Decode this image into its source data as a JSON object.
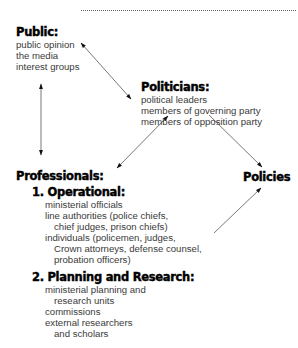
{
  "top_fragment": {
    "chars": [
      "y",
      "y",
      "g"
    ]
  },
  "nodes": {
    "public": {
      "title": "Public:",
      "items": [
        "public opinion",
        "the media",
        "interest groups"
      ]
    },
    "politicians": {
      "title": "Politicians:",
      "items": [
        "political leaders",
        "members of governing party",
        "members of opposition party"
      ]
    },
    "professionals": {
      "title": "Professionals:",
      "operational": {
        "title": "1. Operational:",
        "items": [
          {
            "text": "ministerial officials",
            "indent": false
          },
          {
            "text": "line authorities (police chiefs,",
            "indent": false
          },
          {
            "text": "chief judges, prison chiefs)",
            "indent": true
          },
          {
            "text": "individuals (policemen, judges,",
            "indent": false
          },
          {
            "text": "Crown attorneys, defense counsel,",
            "indent": true
          },
          {
            "text": "probation officers)",
            "indent": true
          }
        ]
      },
      "planning": {
        "title": "2. Planning and Research:",
        "items": [
          {
            "text": "ministerial planning and",
            "indent": false
          },
          {
            "text": "research units",
            "indent": true
          },
          {
            "text": "commissions",
            "indent": false
          },
          {
            "text": "external researchers",
            "indent": false
          },
          {
            "text": "and scholars",
            "indent": true
          }
        ]
      }
    },
    "policies": {
      "title": "Policies"
    }
  },
  "edges": [
    {
      "from": "public",
      "to": "politicians",
      "type": "bidirectional"
    },
    {
      "from": "public",
      "to": "professionals",
      "type": "bidirectional"
    },
    {
      "from": "professionals",
      "to": "politicians",
      "type": "bidirectional"
    },
    {
      "from": "politicians",
      "to": "policies",
      "type": "directed"
    },
    {
      "from": "professionals",
      "to": "policies",
      "type": "directed"
    }
  ],
  "colors": {
    "heading": "#000000",
    "text": "#3a3a3a",
    "arrow": "#555555"
  }
}
